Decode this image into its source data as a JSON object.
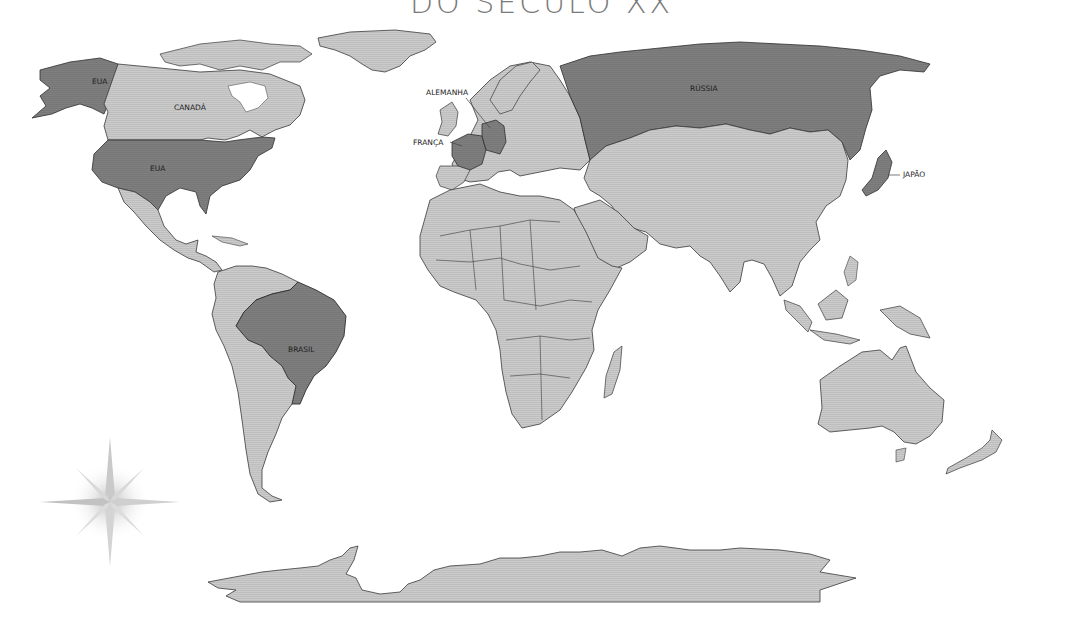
{
  "title": "DO SÉCULO XX",
  "colors": {
    "highlighted_country": "#7f7f7f",
    "other_land": "#cbcbcb",
    "border": "#3a3a3a",
    "ocean": "#ffffff",
    "title_text": "#7a7a7a"
  },
  "labels": {
    "eua_alaska": "EUA",
    "canada": "CANADÁ",
    "eua": "EUA",
    "alemanha": "ALEMANHA",
    "franca": "FRANÇA",
    "russia": "RÚSSIA",
    "japao": "JAPÃO",
    "brasil": "BRASIL"
  },
  "highlighted_countries": [
    "EUA",
    "Alemanha",
    "França",
    "Rússia",
    "Japão",
    "Brasil"
  ],
  "compass_rose": "compass-rose-icon"
}
